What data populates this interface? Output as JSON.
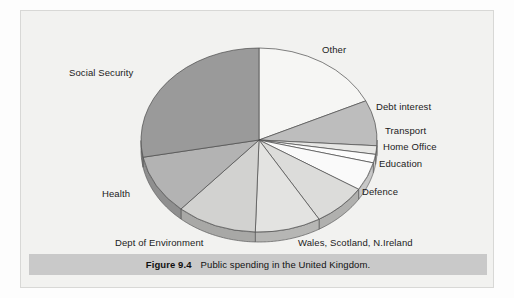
{
  "figure": {
    "caption_label": "Figure 9.4",
    "caption_text": "Public spending in the United Kingdom.",
    "panel_bg": "#f2f2f0",
    "caption_bar_color": "#c9c9c9"
  },
  "chart_data": {
    "type": "pie",
    "title": "Public spending in the United Kingdom",
    "subtitle": "",
    "xlabel": "",
    "ylabel": "",
    "legend_position": "none",
    "labels_position": "outside-callout",
    "start_angle_deg": 0,
    "direction": "clockwise",
    "three_d": true,
    "categories": [
      "Other",
      "Debt interest",
      "Transport",
      "Home Office",
      "Education",
      "Defence",
      "Wales, Scotland, N.Ireland",
      "Dept of Environment",
      "Health",
      "Social Security"
    ],
    "values": [
      18.0,
      8.0,
      1.5,
      1.5,
      5.0,
      7.5,
      9.0,
      11.0,
      10.5,
      28.0
    ],
    "value_unit": "percent",
    "colors": [
      "#f6f6f4",
      "#bdbdbd",
      "#e7e7e5",
      "#fcfcfc",
      "#fafafa",
      "#dcdcda",
      "#e3e3e1",
      "#d2d2d0",
      "#b3b3b3",
      "#9a9a9a"
    ],
    "slices": [
      {
        "name": "Other",
        "value": 18.0,
        "color": "#f6f6f4"
      },
      {
        "name": "Debt interest",
        "value": 8.0,
        "color": "#bdbdbd"
      },
      {
        "name": "Transport",
        "value": 1.5,
        "color": "#e7e7e5"
      },
      {
        "name": "Home Office",
        "value": 1.5,
        "color": "#fcfcfc"
      },
      {
        "name": "Education",
        "value": 5.0,
        "color": "#fafafa"
      },
      {
        "name": "Defence",
        "value": 7.5,
        "color": "#dcdcda"
      },
      {
        "name": "Wales, Scotland, N.Ireland",
        "value": 9.0,
        "color": "#e3e3e1"
      },
      {
        "name": "Dept of Environment",
        "value": 11.0,
        "color": "#d2d2d0"
      },
      {
        "name": "Health",
        "value": 10.5,
        "color": "#b3b3b3"
      },
      {
        "name": "Social Security",
        "value": 28.0,
        "color": "#9a9a9a"
      }
    ]
  },
  "labels": {
    "other": "Other",
    "debt_interest": "Debt interest",
    "transport": "Transport",
    "home_office": "Home Office",
    "education": "Education",
    "defence": "Defence",
    "wales_scotland_nireland": "Wales, Scotland, N.Ireland",
    "dept_of_environment": "Dept of Environment",
    "health": "Health",
    "social_security": "Social Security"
  }
}
